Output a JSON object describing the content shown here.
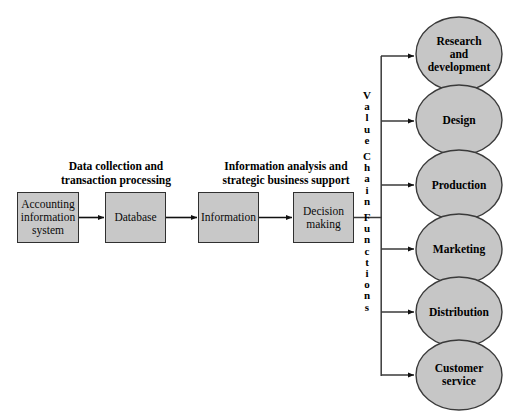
{
  "diagram": {
    "colors": {
      "box_fill": "#c8c8c8",
      "ellipse_fill": "#c6c6c6",
      "stroke": "#303030",
      "text": "#000000",
      "background": "#ffffff"
    },
    "captions": [
      {
        "id": "left-caption",
        "line1": "Data collection and",
        "line2": "transaction processing"
      },
      {
        "id": "right-caption",
        "line1": "Information analysis and",
        "line2": "strategic business support"
      }
    ],
    "flow_boxes": [
      {
        "id": "accounting-information-system",
        "line1": "Accounting",
        "line2": "information",
        "line3": "system"
      },
      {
        "id": "database",
        "line1": "Database",
        "line2": "",
        "line3": ""
      },
      {
        "id": "information",
        "line1": "Information",
        "line2": "",
        "line3": ""
      },
      {
        "id": "decision-making",
        "line1": "Decision",
        "line2": "making",
        "line3": ""
      }
    ],
    "spine": {
      "label": "Value Chain Functions",
      "letters": [
        "V",
        "a",
        "l",
        "u",
        "e",
        "",
        "C",
        "h",
        "a",
        "i",
        "n",
        "",
        "F",
        "u",
        "n",
        "c",
        "t",
        "i",
        "o",
        "n",
        "s"
      ]
    },
    "value_chain_functions": [
      {
        "id": "research-and-development",
        "line1": "Research",
        "line2": "and",
        "line3": "development"
      },
      {
        "id": "design",
        "line1": "Design",
        "line2": "",
        "line3": ""
      },
      {
        "id": "production",
        "line1": "Production",
        "line2": "",
        "line3": ""
      },
      {
        "id": "marketing",
        "line1": "Marketing",
        "line2": "",
        "line3": ""
      },
      {
        "id": "distribution",
        "line1": "Distribution",
        "line2": "",
        "line3": ""
      },
      {
        "id": "customer-service",
        "line1": "Customer",
        "line2": "service",
        "line3": ""
      }
    ]
  }
}
